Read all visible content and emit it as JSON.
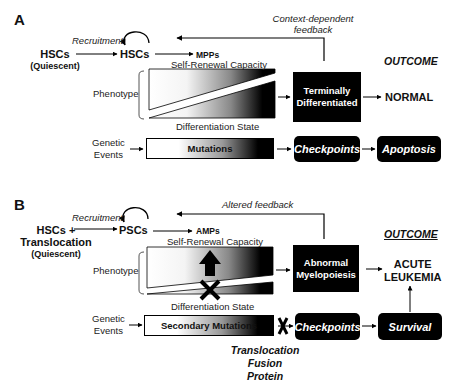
{
  "panel_a": {
    "letter": "A",
    "feedback_label_line1": "Context-dependent",
    "feedback_label_line2": "feedback",
    "source_node_line1": "HSCs",
    "source_node_line2": "(Quiescent)",
    "recruitment_label": "Recruitment",
    "stem_node": "HSCs",
    "progenitor_node": "MPPs",
    "self_renewal_label": "Self-Renewal Capacity",
    "differentiation_label": "Differentiation State",
    "phenotype_label": "Phenotype",
    "genetic_events_line1": "Genetic",
    "genetic_events_line2": "Events",
    "mutations_label": "Mutations",
    "differentiated_box_line1": "Terminally",
    "differentiated_box_line2": "Differentiated",
    "checkpoints_label": "Checkpoints",
    "apoptosis_label": "Apoptosis",
    "outcome_heading": "OUTCOME",
    "outcome_value": "NORMAL"
  },
  "panel_b": {
    "letter": "B",
    "feedback_label": "Altered feedback",
    "source_node_line1": "HSCs +",
    "source_node_line2": "Translocation",
    "source_node_line3": "(Quiescent)",
    "recruitment_label": "Recruitment",
    "stem_node": "PSCs",
    "progenitor_node": "AMPs",
    "self_renewal_label": "Self-Renewal Capacity",
    "differentiation_label": "Differentiation State",
    "phenotype_label": "Phenotype",
    "genetic_events_line1": "Genetic",
    "genetic_events_line2": "Events",
    "mutations_label": "Secondary Mutations",
    "abnormal_box_line1": "Abnormal",
    "abnormal_box_line2": "Myelopoiesis",
    "checkpoints_label": "Checkpoints",
    "survival_label": "Survival",
    "translocation_label_line1": "Translocation",
    "translocation_label_line2": "Fusion Protein",
    "outcome_heading": "OUTCOME",
    "outcome_value_line1": "ACUTE",
    "outcome_value_line2": "LEUKEMIA"
  },
  "icons": {
    "increase": "up-arrow",
    "block": "x-mark",
    "loop": "circular-arrow"
  }
}
